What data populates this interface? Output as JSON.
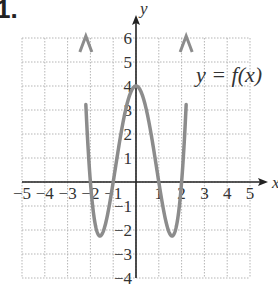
{
  "problem": {
    "number": "1."
  },
  "chart_data": {
    "type": "line",
    "title": "",
    "function_label": "y = f(x)",
    "xlabel": "x",
    "ylabel": "y",
    "xlim": [
      -5,
      5
    ],
    "ylim": [
      -4,
      6
    ],
    "grid": true,
    "x_ticks": [
      "-5",
      "-4",
      "-3",
      "-2",
      "-1",
      "1",
      "2",
      "3",
      "4",
      "5"
    ],
    "y_ticks": [
      "6",
      "5",
      "4",
      "3",
      "2",
      "1",
      "-1",
      "-2",
      "-3",
      "-4"
    ],
    "series": [
      {
        "name": "y = f(x)",
        "x": [
          -2.2,
          -2.0,
          -1.8,
          -1.58,
          -1.4,
          -1.2,
          -1.0,
          -0.75,
          -0.5,
          -0.25,
          0,
          0.25,
          0.5,
          0.75,
          1.0,
          1.2,
          1.4,
          1.58,
          1.8,
          2.0,
          2.2
        ],
        "y": [
          6,
          0,
          -1.7,
          -2.25,
          -2.0,
          -1.1,
          0,
          1.5,
          2.8,
          3.7,
          4,
          3.7,
          2.8,
          1.5,
          0,
          -1.1,
          -2.0,
          -2.25,
          -1.7,
          0,
          6
        ],
        "zeros": [
          -2,
          -1,
          1,
          2
        ],
        "local_max": [
          0,
          4
        ],
        "local_min": [
          [
            -1.58,
            -2.25
          ],
          [
            1.58,
            -2.25
          ]
        ],
        "end_behavior": "arrows upward at both ends"
      }
    ],
    "colors": {
      "curve": "#8c8c8c",
      "axis": "#222222",
      "grid": "#b5b5b5"
    }
  }
}
